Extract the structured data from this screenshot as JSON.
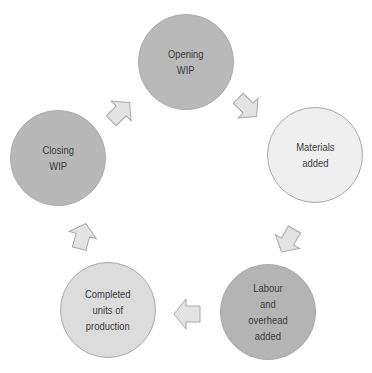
{
  "diagram": {
    "type": "cycle",
    "nodes": [
      {
        "id": "opening-wip",
        "label": "Opening\nWIP",
        "fill": "#b9b9b9",
        "cx": 186,
        "cy": 62,
        "r": 48
      },
      {
        "id": "materials-added",
        "label": "Materials\nadded",
        "fill": "#efefef",
        "cx": 315,
        "cy": 155,
        "r": 48
      },
      {
        "id": "labour-overhead-added",
        "label": "Labour\nand\noverhead\nadded",
        "fill": "#b4b4b4",
        "cx": 268,
        "cy": 312,
        "r": 48
      },
      {
        "id": "completed-units",
        "label": "Completed\nunits of\nproduction",
        "fill": "#dcdcdc",
        "cx": 108,
        "cy": 310,
        "r": 48
      },
      {
        "id": "closing-wip",
        "label": "Closing\nWIP",
        "fill": "#b8b8b8",
        "cx": 58,
        "cy": 158,
        "r": 48
      }
    ],
    "edges": [
      {
        "from": "opening-wip",
        "to": "materials-added",
        "direction": "down-right"
      },
      {
        "from": "materials-added",
        "to": "labour-overhead-added",
        "direction": "down-left"
      },
      {
        "from": "labour-overhead-added",
        "to": "completed-units",
        "direction": "left"
      },
      {
        "from": "completed-units",
        "to": "closing-wip",
        "direction": "up"
      },
      {
        "from": "closing-wip",
        "to": "opening-wip",
        "direction": "up-right"
      }
    ],
    "arrow_fill": "#e3e3e3",
    "arrow_stroke": "#a7a7a7"
  }
}
